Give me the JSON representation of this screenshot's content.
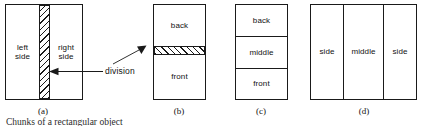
{
  "figure": {
    "caption": "Chunks of a rectangular object",
    "annotation": {
      "label": "division"
    },
    "panels": [
      {
        "id": "a",
        "sub_caption": "(a)",
        "orientation": "vertical-split",
        "regions": [
          {
            "name": "left-side",
            "label": "left\nside"
          },
          {
            "name": "division",
            "label": ""
          },
          {
            "name": "right-side",
            "label": "right\nside"
          }
        ]
      },
      {
        "id": "b",
        "sub_caption": "(b)",
        "orientation": "horizontal-split",
        "regions": [
          {
            "name": "back",
            "label": "back"
          },
          {
            "name": "division",
            "label": ""
          },
          {
            "name": "front",
            "label": "front"
          }
        ]
      },
      {
        "id": "c",
        "sub_caption": "(c)",
        "orientation": "horizontal-split",
        "regions": [
          {
            "name": "back",
            "label": "back"
          },
          {
            "name": "middle",
            "label": "middle"
          },
          {
            "name": "front",
            "label": "front"
          }
        ]
      },
      {
        "id": "d",
        "sub_caption": "(d)",
        "orientation": "vertical-split",
        "regions": [
          {
            "name": "side-left",
            "label": "side"
          },
          {
            "name": "middle",
            "label": "middle"
          },
          {
            "name": "side-right",
            "label": "side"
          }
        ]
      }
    ]
  },
  "colors": {
    "ink": "#1a1a1a",
    "paper": "#ffffff",
    "caption": "#2b2b2b"
  }
}
